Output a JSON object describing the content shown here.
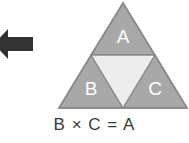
{
  "diagram": {
    "background_color": "#ffffff",
    "arrow": {
      "icon": "arrow-left-icon",
      "direction": "left",
      "color": "#333333"
    },
    "triangle": {
      "outline_color": "#8f8f8f",
      "fill_color": "#a8a8a8",
      "center_fill_color": "#ededed",
      "label_color": "#ffffff",
      "parts": [
        {
          "id": "top",
          "label": "A",
          "position": "top"
        },
        {
          "id": "bottom-left",
          "label": "B",
          "position": "bottom-left"
        },
        {
          "id": "bottom-right",
          "label": "C",
          "position": "bottom-right"
        },
        {
          "id": "center",
          "label": "",
          "position": "center-inverted"
        }
      ]
    },
    "equation": {
      "text": "B × C = A",
      "operand_left": "B",
      "operator": "×",
      "operand_right": "C",
      "equals": "=",
      "result": "A"
    }
  }
}
